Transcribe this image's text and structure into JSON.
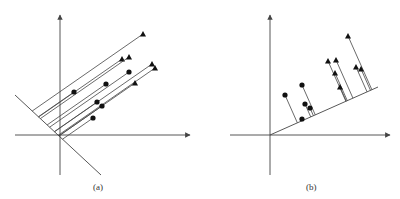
{
  "panels": [
    {
      "id": "a",
      "caption": "(a)",
      "caption_pos": [
        93,
        182
      ],
      "origin": [
        60,
        135
      ],
      "x_axis": {
        "from": [
          15,
          135
        ],
        "to": [
          190,
          135
        ]
      },
      "y_axis": {
        "from": [
          60,
          175
        ],
        "to": [
          60,
          15
        ]
      },
      "boundary_line": {
        "from": [
          15,
          95
        ],
        "to": [
          101,
          175
        ]
      },
      "projection_direction": [
        -0.82,
        0.57
      ],
      "points": [
        {
          "x": 143,
          "y": 34,
          "marker": "triangle"
        },
        {
          "x": 122,
          "y": 59,
          "marker": "triangle"
        },
        {
          "x": 129,
          "y": 57,
          "marker": "triangle"
        },
        {
          "x": 152,
          "y": 64,
          "marker": "triangle"
        },
        {
          "x": 155,
          "y": 68,
          "marker": "triangle"
        },
        {
          "x": 135,
          "y": 83,
          "marker": "triangle"
        },
        {
          "x": 74,
          "y": 92,
          "marker": "circle"
        },
        {
          "x": 106,
          "y": 84,
          "marker": "circle"
        },
        {
          "x": 129,
          "y": 72,
          "marker": "circle"
        },
        {
          "x": 97,
          "y": 102,
          "marker": "circle"
        },
        {
          "x": 102,
          "y": 106,
          "marker": "circle"
        },
        {
          "x": 93,
          "y": 118,
          "marker": "circle"
        }
      ]
    },
    {
      "id": "b",
      "caption": "(b)",
      "caption_pos": [
        306,
        182
      ],
      "origin": [
        270,
        135
      ],
      "x_axis": {
        "from": [
          230,
          135
        ],
        "to": [
          390,
          135
        ]
      },
      "y_axis": {
        "from": [
          270,
          175
        ],
        "to": [
          270,
          15
        ]
      },
      "projection_line": {
        "from": [
          270,
          135
        ],
        "to": [
          378,
          87
        ]
      },
      "points": [
        {
          "x": 285,
          "y": 95,
          "marker": "circle"
        },
        {
          "x": 302,
          "y": 85,
          "marker": "circle"
        },
        {
          "x": 305,
          "y": 104,
          "marker": "circle"
        },
        {
          "x": 310,
          "y": 108,
          "marker": "circle"
        },
        {
          "x": 302,
          "y": 119,
          "marker": "circle"
        },
        {
          "x": 328,
          "y": 61,
          "marker": "triangle"
        },
        {
          "x": 336,
          "y": 60,
          "marker": "triangle"
        },
        {
          "x": 335,
          "y": 73,
          "marker": "triangle"
        },
        {
          "x": 340,
          "y": 87,
          "marker": "triangle"
        },
        {
          "x": 348,
          "y": 36,
          "marker": "triangle"
        },
        {
          "x": 356,
          "y": 67,
          "marker": "triangle"
        },
        {
          "x": 361,
          "y": 69,
          "marker": "triangle"
        }
      ]
    }
  ],
  "colors": {
    "stroke": "#444444",
    "marker": "#111111",
    "background": "#ffffff"
  }
}
